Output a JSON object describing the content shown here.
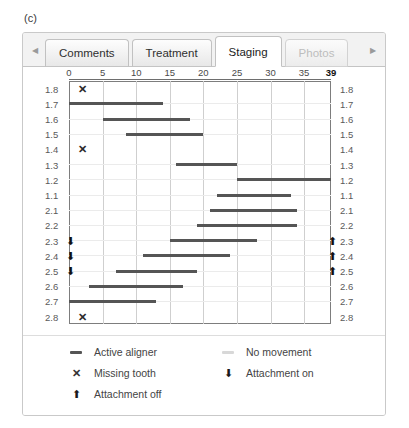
{
  "figure": {
    "caption": "(c)"
  },
  "tabbar": {
    "scroll_left_icon": "triangle-left-icon",
    "scroll_right_icon": "triangle-right-icon",
    "tabs": [
      {
        "label": "Comments",
        "state": "normal"
      },
      {
        "label": "Treatment",
        "state": "normal"
      },
      {
        "label": "Staging",
        "state": "active"
      },
      {
        "label": "Photos",
        "state": "disabled"
      }
    ]
  },
  "legend": {
    "items": [
      {
        "symbol": "bar-dark",
        "label": "Active aligner"
      },
      {
        "symbol": "bar-light",
        "label": "No movement"
      },
      {
        "symbol": "x-mark",
        "label": "Missing tooth"
      },
      {
        "symbol": "arrow-down",
        "label": "Attachment on"
      },
      {
        "symbol": "arrow-up",
        "label": "Attachment off"
      }
    ]
  },
  "chart_data": {
    "type": "bar",
    "orientation": "horizontal",
    "title": "",
    "xlabel": "",
    "ylabel": "",
    "xlim": [
      0,
      39
    ],
    "xticks": [
      0,
      5,
      10,
      15,
      20,
      25,
      30,
      35,
      39
    ],
    "xtick_labels": [
      "0",
      "5",
      "10",
      "15",
      "20",
      "25",
      "30",
      "35",
      "39"
    ],
    "xtick_bold": [
      "39"
    ],
    "grid": true,
    "legend_position": "bottom",
    "categories": [
      "1.8",
      "1.7",
      "1.6",
      "1.5",
      "1.4",
      "1.3",
      "1.2",
      "1.1",
      "2.1",
      "2.2",
      "2.3",
      "2.4",
      "2.5",
      "2.6",
      "2.7",
      "2.8"
    ],
    "rows": [
      {
        "tooth": "1.8",
        "start": null,
        "end": null,
        "missing": true,
        "attachment_on": false,
        "attachment_off": false
      },
      {
        "tooth": "1.7",
        "start": 0,
        "end": 14,
        "missing": false,
        "attachment_on": false,
        "attachment_off": false
      },
      {
        "tooth": "1.6",
        "start": 5,
        "end": 18,
        "missing": false,
        "attachment_on": false,
        "attachment_off": false
      },
      {
        "tooth": "1.5",
        "start": 8.5,
        "end": 20,
        "missing": false,
        "attachment_on": false,
        "attachment_off": false
      },
      {
        "tooth": "1.4",
        "start": null,
        "end": null,
        "missing": true,
        "attachment_on": false,
        "attachment_off": false
      },
      {
        "tooth": "1.3",
        "start": 16,
        "end": 25,
        "missing": false,
        "attachment_on": false,
        "attachment_off": false
      },
      {
        "tooth": "1.2",
        "start": 25,
        "end": 39,
        "missing": false,
        "attachment_on": false,
        "attachment_off": false
      },
      {
        "tooth": "1.1",
        "start": 22,
        "end": 33,
        "missing": false,
        "attachment_on": false,
        "attachment_off": false
      },
      {
        "tooth": "2.1",
        "start": 21,
        "end": 34,
        "missing": false,
        "attachment_on": false,
        "attachment_off": false
      },
      {
        "tooth": "2.2",
        "start": 19,
        "end": 34,
        "missing": false,
        "attachment_on": false,
        "attachment_off": false
      },
      {
        "tooth": "2.3",
        "start": 15,
        "end": 28,
        "missing": false,
        "attachment_on": true,
        "attachment_off": true
      },
      {
        "tooth": "2.4",
        "start": 11,
        "end": 24,
        "missing": false,
        "attachment_on": true,
        "attachment_off": true
      },
      {
        "tooth": "2.5",
        "start": 7,
        "end": 19,
        "missing": false,
        "attachment_on": true,
        "attachment_off": true
      },
      {
        "tooth": "2.6",
        "start": 3,
        "end": 17,
        "missing": false,
        "attachment_on": false,
        "attachment_off": false
      },
      {
        "tooth": "2.7",
        "start": 0,
        "end": 13,
        "missing": false,
        "attachment_on": false,
        "attachment_off": false
      },
      {
        "tooth": "2.8",
        "start": null,
        "end": null,
        "missing": true,
        "attachment_on": false,
        "attachment_off": false
      }
    ],
    "missing_marker_x": 2,
    "colors": {
      "bar": "#555555",
      "no_movement": "#e8e8e8",
      "gridline": "#cfcfcf",
      "rowline": "#ebebeb",
      "plot_border": "#7d7d7d",
      "text": "#4a4a4a"
    }
  }
}
